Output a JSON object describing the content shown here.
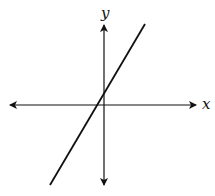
{
  "diagram": {
    "type": "coordinate-plane-with-line",
    "x_axis_label": "x",
    "y_axis_label": "y",
    "colors": {
      "axis": "#111111",
      "line": "#111111",
      "background": "#ffffff"
    },
    "origin_px": [
      104,
      105
    ],
    "x_axis": {
      "from_px": [
        10,
        105
      ],
      "to_px": [
        196,
        105
      ],
      "arrows": "both"
    },
    "y_axis": {
      "from_px": [
        104,
        25
      ],
      "to_px": [
        104,
        185
      ],
      "arrows": "both"
    },
    "line": {
      "from_px": [
        50,
        185
      ],
      "to_px": [
        145,
        24
      ],
      "slope_sign": "positive",
      "x_intercept": "negative (just left of origin)",
      "y_intercept": "positive (just above origin)"
    }
  }
}
